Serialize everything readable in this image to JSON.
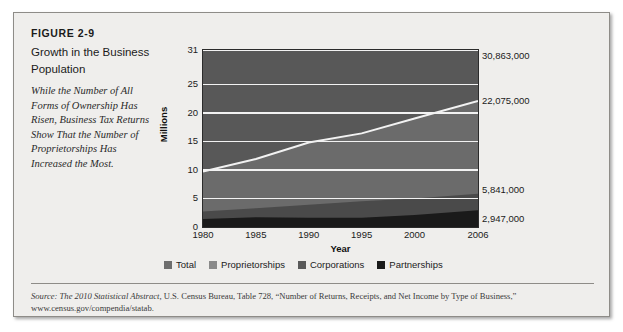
{
  "figure": {
    "number": "FIGURE 2-9",
    "title": "Growth in the Business Population",
    "subtitle": "While the Number of All Forms of Ownership Has Risen, Business Tax Returns Show That the Number of Proprietorships Has Increased the Most."
  },
  "source": {
    "lead": "Source: The 2010 Statistical Abstract,",
    "rest": " U.S. Census Bureau, Table 728, “Number of Returns, Receipts, and Net Income by Type of Business,” www.census.gov/compendia/statab."
  },
  "colors": {
    "total": "#585858",
    "proprietorships": "#6b6b6b",
    "corporations": "#4a4a4a",
    "partnerships": "#1a1a1a",
    "gridline": "#f2f2f2",
    "plot_border": "#2b2b2b",
    "card_background": "#efeeec"
  },
  "chart_data": {
    "type": "area",
    "title": "Growth in the Business Population",
    "xlabel": "Year",
    "ylabel": "Millions",
    "xlim": [
      1980,
      2006
    ],
    "ylim": [
      0,
      31
    ],
    "yticks": [
      0,
      5,
      10,
      15,
      20,
      25,
      31
    ],
    "xticks": [
      1980,
      1985,
      1990,
      1995,
      2000,
      2006
    ],
    "grid": true,
    "legend_position": "bottom",
    "x": [
      1980,
      1985,
      1990,
      1995,
      2000,
      2006
    ],
    "series": [
      {
        "name": "Total",
        "values": [
          16.8,
          19.6,
          22.6,
          25.0,
          27.7,
          30.863
        ]
      },
      {
        "name": "Proprietorships",
        "values": [
          9.7,
          11.9,
          14.8,
          16.4,
          19.0,
          22.075
        ]
      },
      {
        "name": "Corporations",
        "values": [
          2.7,
          3.3,
          3.9,
          4.5,
          5.0,
          5.841
        ]
      },
      {
        "name": "Partnerships",
        "values": [
          1.4,
          1.7,
          1.6,
          1.6,
          2.1,
          2.947
        ]
      }
    ],
    "annotations": [
      {
        "label": "30,863,000",
        "value": 30.863,
        "series": "Total"
      },
      {
        "label": "22,075,000",
        "value": 22.075,
        "series": "Proprietorships"
      },
      {
        "label": "5,841,000",
        "value": 5.841,
        "series": "Corporations"
      },
      {
        "label": "2,947,000",
        "value": 2.947,
        "series": "Partnerships"
      }
    ],
    "legend": [
      {
        "label": "Total",
        "color": "#6e6e6e"
      },
      {
        "label": "Proprietorships",
        "color": "#8a8a8a"
      },
      {
        "label": "Corporations",
        "color": "#5a5a5a"
      },
      {
        "label": "Partnerships",
        "color": "#1a1a1a"
      }
    ]
  }
}
